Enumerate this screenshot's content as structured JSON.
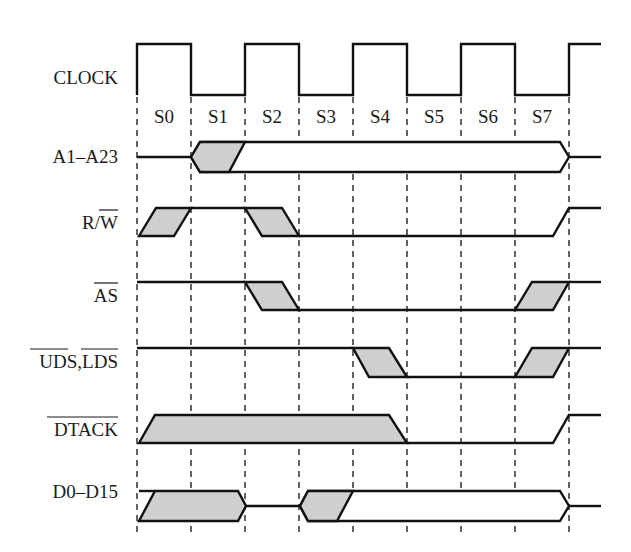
{
  "diagram": {
    "type": "timing-diagram",
    "signals": [
      {
        "id": "clock",
        "label": "CLOCK",
        "overbar": []
      },
      {
        "id": "address",
        "label": "A1–A23",
        "overbar": []
      },
      {
        "id": "rw",
        "label": "R/W",
        "overbar": [
          "W"
        ]
      },
      {
        "id": "as",
        "label": "AS",
        "overbar": [
          "AS"
        ]
      },
      {
        "id": "uds_lds",
        "label": "UDS,LDS",
        "overbar": [
          "UDS",
          "LDS"
        ]
      },
      {
        "id": "dtack",
        "label": "DTACK",
        "overbar": [
          "DTACK"
        ]
      },
      {
        "id": "data",
        "label": "D0–D15",
        "overbar": []
      }
    ],
    "states": [
      "S0",
      "S1",
      "S2",
      "S3",
      "S4",
      "S5",
      "S6",
      "S7"
    ],
    "colors": {
      "line": "#111111",
      "shade": "#cfcfcf",
      "background": "#ffffff"
    }
  },
  "labels": {
    "clock": "CLOCK",
    "address": "A1–A23",
    "rw_r": "R/",
    "rw_w": "W",
    "as": "AS",
    "uds": "UDS",
    "comma": ",",
    "lds": "LDS",
    "dtack": "DTACK",
    "data": "D0–D15"
  },
  "states": {
    "s0": "S0",
    "s1": "S1",
    "s2": "S2",
    "s3": "S3",
    "s4": "S4",
    "s5": "S5",
    "s6": "S6",
    "s7": "S7"
  }
}
